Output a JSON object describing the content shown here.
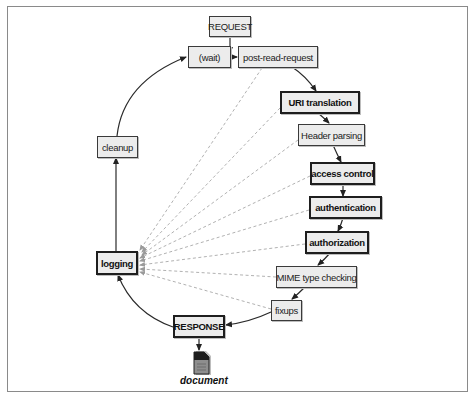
{
  "diagram": {
    "type": "request-processing-cycle",
    "nodes": {
      "request": {
        "label": "REQUEST",
        "bold": false
      },
      "wait": {
        "label": "(wait)",
        "bold": false
      },
      "post_read_request": {
        "label": "post-read-request",
        "bold": false
      },
      "uri_translation": {
        "label": "URI translation",
        "bold": true
      },
      "header_parsing": {
        "label": "Header parsing",
        "bold": false
      },
      "access_control": {
        "label": "access control",
        "bold": true
      },
      "authentication": {
        "label": "authentication",
        "bold": true
      },
      "authorization": {
        "label": "authorization",
        "bold": true
      },
      "mime_type_checking": {
        "label": "MIME type checking",
        "bold": false
      },
      "fixups": {
        "label": "fixups",
        "bold": false
      },
      "response": {
        "label": "RESPONSE",
        "bold": true
      },
      "cleanup": {
        "label": "cleanup",
        "bold": false
      },
      "logging": {
        "label": "logging",
        "bold": true
      },
      "document": {
        "label": "document",
        "icon": "document-icon"
      }
    },
    "edges": [
      {
        "from": "request",
        "to": "post_read_request",
        "style": "solid"
      },
      {
        "from": "wait",
        "to": "post_read_request",
        "style": "solid"
      },
      {
        "from": "post_read_request",
        "to": "uri_translation",
        "style": "solid"
      },
      {
        "from": "uri_translation",
        "to": "header_parsing",
        "style": "solid"
      },
      {
        "from": "header_parsing",
        "to": "access_control",
        "style": "solid"
      },
      {
        "from": "access_control",
        "to": "authentication",
        "style": "solid"
      },
      {
        "from": "authentication",
        "to": "authorization",
        "style": "solid"
      },
      {
        "from": "authorization",
        "to": "mime_type_checking",
        "style": "solid"
      },
      {
        "from": "mime_type_checking",
        "to": "fixups",
        "style": "solid"
      },
      {
        "from": "fixups",
        "to": "response",
        "style": "solid"
      },
      {
        "from": "response",
        "to": "document",
        "style": "solid"
      },
      {
        "from": "response",
        "to": "logging",
        "style": "solid"
      },
      {
        "from": "logging",
        "to": "cleanup",
        "style": "solid"
      },
      {
        "from": "cleanup",
        "to": "wait",
        "style": "solid"
      },
      {
        "from": "post_read_request",
        "to": "logging",
        "style": "dashed"
      },
      {
        "from": "uri_translation",
        "to": "logging",
        "style": "dashed"
      },
      {
        "from": "header_parsing",
        "to": "logging",
        "style": "dashed"
      },
      {
        "from": "access_control",
        "to": "logging",
        "style": "dashed"
      },
      {
        "from": "authentication",
        "to": "logging",
        "style": "dashed"
      },
      {
        "from": "authorization",
        "to": "logging",
        "style": "dashed"
      },
      {
        "from": "mime_type_checking",
        "to": "logging",
        "style": "dashed"
      },
      {
        "from": "fixups",
        "to": "logging",
        "style": "dashed"
      }
    ],
    "colors": {
      "box_fill": "#ececec",
      "box_border": "#1e1e1e",
      "arrow": "#333333",
      "dashed": "#a0a0a0",
      "frame": "#8a8a8a"
    }
  }
}
